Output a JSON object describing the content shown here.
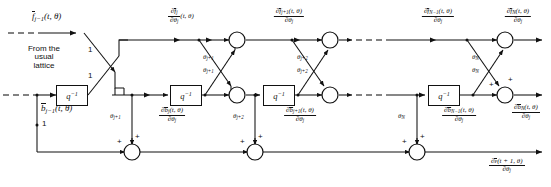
{
  "figure": {
    "kind": "signal-flow-diagram",
    "title_visible": false,
    "background": "#ffffff",
    "line_color": "#111111"
  },
  "annotations": {
    "from_usual_lattice": "From the\nusual\nlattice",
    "from_line1": "From the",
    "from_line2": "usual",
    "from_line3": "lattice"
  },
  "inputs": {
    "f_prev": {
      "base": "f",
      "overbar": true,
      "sub": "j−1",
      "args": "(t, θ)"
    },
    "b_prev": {
      "base": "b",
      "overbar": true,
      "sub": "j−1",
      "args": "(t, θ)"
    },
    "gain_top": "1",
    "gain_mid": "1",
    "gain_bottom": "1"
  },
  "delay_blocks": [
    {
      "id": "q-delay-1",
      "label": "q",
      "exp": "−1"
    },
    {
      "id": "q-delay-2",
      "label": "q",
      "exp": "−1"
    },
    {
      "id": "q-delay-3",
      "label": "q",
      "exp": "−1"
    },
    {
      "id": "q-delay-4",
      "label": "q",
      "exp": "−1"
    }
  ],
  "forward_labels": [
    {
      "id": "df_j",
      "num": "∂f",
      "num_sub": "j",
      "num_overbar": true,
      "den": "∂θ",
      "den_sub": "j",
      "args": "(t, θ)",
      "args_inline": true
    },
    {
      "id": "df_j1",
      "num": "∂f",
      "num_sub": "j+1",
      "num_overbar": true,
      "num_args": "(t, θ)",
      "den": "∂θ",
      "den_sub": "j",
      "args_inline": false
    },
    {
      "id": "df_N1",
      "num": "∂f",
      "num_sub": "N−1",
      "num_overbar": true,
      "num_args": "(t, θ)",
      "den": "∂θ",
      "den_sub": "j",
      "args_inline": false
    },
    {
      "id": "df_N",
      "num": "∂f",
      "num_sub": "N",
      "num_overbar": true,
      "num_args": "(t, θ)",
      "den": "∂θ",
      "den_sub": "j",
      "args_inline": false
    }
  ],
  "backward_labels": [
    {
      "id": "db_j",
      "num": "∂b",
      "num_sub": "j",
      "num_overbar": true,
      "num_args": "(t, θ)",
      "den": "∂θ",
      "den_sub": "j"
    },
    {
      "id": "db_j1",
      "num": "∂b",
      "num_sub": "j+1",
      "num_overbar": true,
      "num_args": "(t, θ)",
      "den": "∂θ",
      "den_sub": "j"
    },
    {
      "id": "db_N1",
      "num": "∂b",
      "num_sub": "N−1",
      "num_overbar": true,
      "num_args": "(t, θ)",
      "den": "∂θ",
      "den_sub": "j"
    },
    {
      "id": "db_N",
      "num": "∂b",
      "num_sub": "N",
      "num_overbar": true,
      "num_args": "(t, θ)",
      "den": "∂θ",
      "den_sub": "j"
    }
  ],
  "output_label": {
    "id": "de_out",
    "num": "∂ε",
    "num_overbar": true,
    "num_args": "(t + 1, θ)",
    "den": "∂θ",
    "den_sub": "j"
  },
  "reflection_coeffs": [
    {
      "id": "theta-j1-upper",
      "base": "θ",
      "sub": "j+1"
    },
    {
      "id": "theta-j1-lower",
      "base": "θ",
      "sub": "j+1"
    },
    {
      "id": "theta-j1-vert",
      "base": "θ",
      "sub": "j+1"
    },
    {
      "id": "theta-j2-upper",
      "base": "θ",
      "sub": "j+2"
    },
    {
      "id": "theta-j2-lower",
      "base": "θ",
      "sub": "j+2"
    },
    {
      "id": "theta-j2-vert",
      "base": "θ",
      "sub": "j+2"
    },
    {
      "id": "theta-N-upper",
      "base": "θ",
      "sub": "N"
    },
    {
      "id": "theta-N-lower",
      "base": "θ",
      "sub": "N"
    },
    {
      "id": "theta-N-vert",
      "base": "θ",
      "sub": "N"
    }
  ],
  "sum_signs": {
    "plus": "+"
  },
  "stages": [
    {
      "name": "stage-j-plus-1"
    },
    {
      "name": "stage-j-plus-2"
    },
    {
      "name": "stage-N"
    }
  ]
}
